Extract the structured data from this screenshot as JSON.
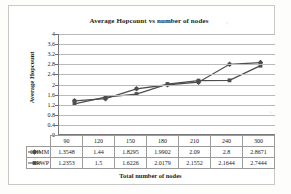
{
  "chart_data": {
    "type": "line",
    "title": "Average Hopcount vs number of nodes",
    "xlabel": "Total number of nodes",
    "ylabel": "Average Hopcount",
    "categories": [
      "90",
      "120",
      "150",
      "180",
      "210",
      "240",
      "300"
    ],
    "ylim": [
      0,
      4
    ],
    "yticks": [
      "4",
      "3.6",
      "3.2",
      "2.8",
      "2.4",
      "2",
      "1.6",
      "1.2",
      "0.8",
      "0.4",
      "0"
    ],
    "grid": "horizontal",
    "legend_position": "data-table-row-labels",
    "series": [
      {
        "name": "CHMM",
        "marker": "cross-diamond",
        "color": "#4d4d4d",
        "values": [
          1.3548,
          1.44,
          1.8295,
          1.9902,
          2.09,
          2.8,
          2.8671
        ],
        "labels": [
          "1.3548",
          "1.44",
          "1.8295",
          "1.9902",
          "2.09",
          "2.8",
          "2.8671"
        ]
      },
      {
        "name": "RWP",
        "marker": "square",
        "color": "#4d4d4d",
        "values": [
          1.2353,
          1.5,
          1.6226,
          2.0179,
          2.1552,
          2.1644,
          2.7444
        ],
        "labels": [
          "1.2353",
          "1.5",
          "1.6226",
          "2.0179",
          "2.1552",
          "2.1644",
          "2.7444"
        ]
      }
    ]
  }
}
